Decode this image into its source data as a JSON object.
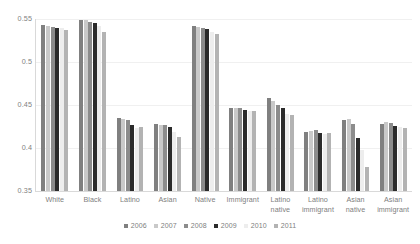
{
  "chart_data": {
    "type": "bar",
    "title": "",
    "subtitle": "",
    "xlabel": "",
    "ylabel": "",
    "ylim": [
      0.35,
      0.55
    ],
    "yticks": [
      "0.35",
      "0.4",
      "0.45",
      "0.5",
      "0.55"
    ],
    "ytick_values": [
      0.35,
      0.4,
      0.45,
      0.5,
      0.55
    ],
    "grid": true,
    "legend_position": "bottom",
    "categories": [
      "White",
      "Black",
      "Latino",
      "Asian",
      "Native",
      "Immigrant",
      "Latino\nnative",
      "Latino\nimmigrant",
      "Asian native",
      "Asian\nimmigrant"
    ],
    "series": [
      {
        "name": "2006",
        "color": "#808080",
        "values": [
          0.543,
          0.549,
          0.435,
          0.428,
          0.542,
          0.447,
          0.458,
          0.419,
          0.433,
          0.428
        ]
      },
      {
        "name": "2007",
        "color": "#c9c9c9",
        "values": [
          0.542,
          0.549,
          0.434,
          0.427,
          0.541,
          0.447,
          0.455,
          0.42,
          0.434,
          0.43
        ]
      },
      {
        "name": "2008",
        "color": "#8c8c8c",
        "values": [
          0.541,
          0.546,
          0.432,
          0.427,
          0.54,
          0.446,
          0.45,
          0.421,
          0.428,
          0.429
        ]
      },
      {
        "name": "2009",
        "color": "#2b2b2b",
        "values": [
          0.54,
          0.545,
          0.427,
          0.424,
          0.538,
          0.444,
          0.446,
          0.417,
          0.412,
          0.426
        ]
      },
      {
        "name": "2010",
        "color": "#ededed",
        "values": [
          0.539,
          0.542,
          0.423,
          0.419,
          0.535,
          0.443,
          0.44,
          0.416,
          0.398,
          0.424
        ]
      },
      {
        "name": "2011",
        "color": "#b3b3b3",
        "values": [
          0.537,
          0.535,
          0.424,
          0.413,
          0.532,
          0.443,
          0.438,
          0.418,
          0.378,
          0.423
        ]
      }
    ],
    "legend": [
      "2006",
      "2007",
      "2008",
      "2009",
      "2010",
      "2011"
    ]
  }
}
